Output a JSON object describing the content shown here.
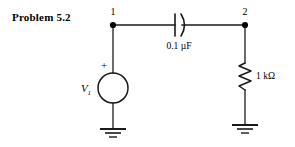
{
  "figure": {
    "title": "Problem 5.2",
    "nodes": [
      {
        "name": "node-1",
        "label": "1"
      },
      {
        "name": "node-2",
        "label": "2"
      }
    ],
    "components": {
      "capacitor": {
        "icon": "capacitor-icon",
        "label": "0.1 µF"
      },
      "resistor": {
        "icon": "resistor-icon",
        "label": "1 kΩ"
      },
      "source": {
        "icon": "voltage-source-icon",
        "label": "V",
        "subscript": "1",
        "polarity": "+"
      },
      "grounds": [
        {
          "icon": "ground-icon",
          "label": ""
        },
        {
          "icon": "ground-icon",
          "label": ""
        }
      ]
    },
    "colors": {
      "ink": "#000000",
      "background": "#ffffff"
    }
  }
}
